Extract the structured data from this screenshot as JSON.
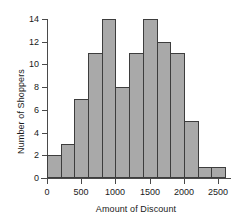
{
  "chart_data": {
    "type": "bar",
    "title": "",
    "xlabel": "Amount of Discount",
    "ylabel": "Number of Shoppers",
    "bin_width": 200,
    "bin_starts": [
      0,
      200,
      400,
      600,
      800,
      1000,
      1200,
      1400,
      1600,
      1800,
      2000,
      2200,
      2400
    ],
    "categories": [
      "0-200",
      "200-400",
      "400-600",
      "600-800",
      "800-1000",
      "1000-1200",
      "1200-1400",
      "1400-1600",
      "1600-1800",
      "1800-2000",
      "2000-2200",
      "2200-2400",
      "2400-2600"
    ],
    "values": [
      2,
      3,
      7,
      11,
      14,
      8,
      11,
      14,
      12,
      11,
      5,
      1,
      1
    ],
    "xlim": [
      0,
      2600
    ],
    "ylim": [
      0,
      14
    ],
    "xticks": [
      0,
      500,
      1000,
      1500,
      2000,
      2500
    ],
    "xtick_labels": [
      "0",
      "500",
      "1000",
      "1500",
      "2000",
      "2500"
    ],
    "yticks": [
      0,
      2,
      4,
      6,
      8,
      10,
      12,
      14
    ],
    "ytick_labels": [
      "0",
      "2",
      "4",
      "6",
      "8",
      "10",
      "12",
      "14"
    ],
    "grid": false,
    "legend": false,
    "bar_fill_color": "#a9a9a9",
    "bar_edge_color": "#3d3d3d",
    "axis_color": "#4a4a4a",
    "background_color": "#ffffff"
  }
}
